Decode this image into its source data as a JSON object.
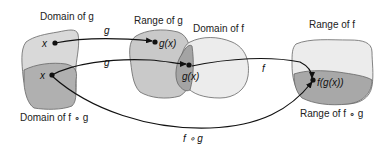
{
  "diagram": {
    "title_labels": {
      "domain_g": "Domain of g",
      "range_g": "Range of g",
      "domain_f": "Domain of f",
      "range_f": "Range of f",
      "domain_fog": "Domain of f ∘ g",
      "range_fog": "Range of f ∘ g"
    },
    "point_labels": {
      "x_top": "x",
      "x_bottom": "x",
      "gx_top": "g(x)",
      "gx_mid": "g(x)",
      "fgx": "f(g(x))"
    },
    "arrow_labels": {
      "g_top": "g",
      "g_bottom": "g",
      "f": "f",
      "fog": "f ∘ g"
    },
    "colors": {
      "light_fill": "#d9d9d9",
      "mid_fill": "#b3b3b3",
      "dark_fill": "#9a9a9a",
      "lightest_fill": "#ececec",
      "stroke": "#555555",
      "arrow": "#111111"
    }
  }
}
